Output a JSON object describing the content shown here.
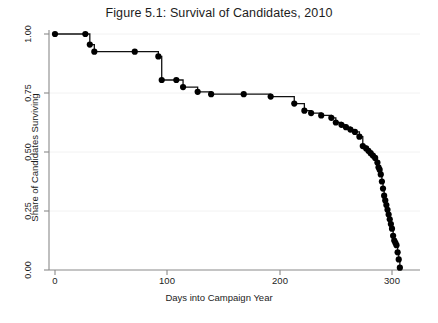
{
  "chart_data": {
    "type": "line",
    "title": "Figure 5.1: Survival of Candidates, 2010",
    "xlabel": "Days into Campaign Year",
    "ylabel": "Share of Candidates Surviving",
    "xlim": [
      0,
      310
    ],
    "ylim": [
      0,
      1
    ],
    "xticks": [
      0,
      100,
      200,
      300
    ],
    "xticklabels": [
      "0",
      "100",
      "200",
      "300"
    ],
    "yticks": [
      0.0,
      0.25,
      0.5,
      0.75,
      1.0
    ],
    "yticklabels": [
      "0.00",
      "0.25",
      "0.50",
      "0.75",
      "1.00"
    ],
    "grid": "faint-horizontal",
    "legend": "none",
    "step_style": "post",
    "marker": "filled-circle",
    "line_color": "#111111",
    "marker_color": "#000000",
    "series": [
      {
        "name": "Share of Candidates Surviving",
        "x": [
          0,
          27,
          31,
          35,
          71,
          92,
          95,
          108,
          114,
          127,
          139,
          168,
          192,
          213,
          222,
          228,
          237,
          246,
          250,
          255,
          259,
          263,
          267,
          271,
          274,
          277,
          279,
          281,
          283,
          285,
          287,
          288,
          289,
          290,
          291,
          292,
          293,
          294,
          295,
          296,
          297,
          298,
          299,
          300,
          301,
          302,
          303,
          304,
          305,
          306,
          307
        ],
        "y": [
          1.0,
          1.0,
          0.955,
          0.925,
          0.925,
          0.905,
          0.805,
          0.805,
          0.775,
          0.755,
          0.745,
          0.745,
          0.735,
          0.705,
          0.675,
          0.665,
          0.655,
          0.645,
          0.625,
          0.615,
          0.605,
          0.595,
          0.585,
          0.565,
          0.525,
          0.515,
          0.505,
          0.495,
          0.485,
          0.475,
          0.455,
          0.435,
          0.425,
          0.405,
          0.375,
          0.345,
          0.315,
          0.295,
          0.275,
          0.255,
          0.235,
          0.215,
          0.195,
          0.175,
          0.145,
          0.125,
          0.115,
          0.105,
          0.075,
          0.045,
          0.01
        ]
      }
    ]
  }
}
